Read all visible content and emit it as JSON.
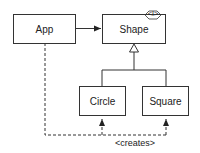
{
  "diagram": {
    "type": "uml-class",
    "nodes": [
      {
        "id": "app",
        "label": "App"
      },
      {
        "id": "shape",
        "label": "Shape",
        "stereotype": "<I>"
      },
      {
        "id": "circle",
        "label": "Circle"
      },
      {
        "id": "square",
        "label": "Square"
      }
    ],
    "edges": [
      {
        "from": "app",
        "to": "shape",
        "kind": "association"
      },
      {
        "from": "circle",
        "to": "shape",
        "kind": "realization"
      },
      {
        "from": "square",
        "to": "shape",
        "kind": "realization"
      },
      {
        "from": "app",
        "to": "circle",
        "kind": "dependency",
        "label": "<creates>"
      },
      {
        "from": "app",
        "to": "square",
        "kind": "dependency",
        "label": "<creates>"
      }
    ],
    "creates_label": "<creates>",
    "interface_marker": "<I>"
  },
  "colors": {
    "line": "#333333",
    "text": "#222222",
    "background": "#ffffff"
  }
}
